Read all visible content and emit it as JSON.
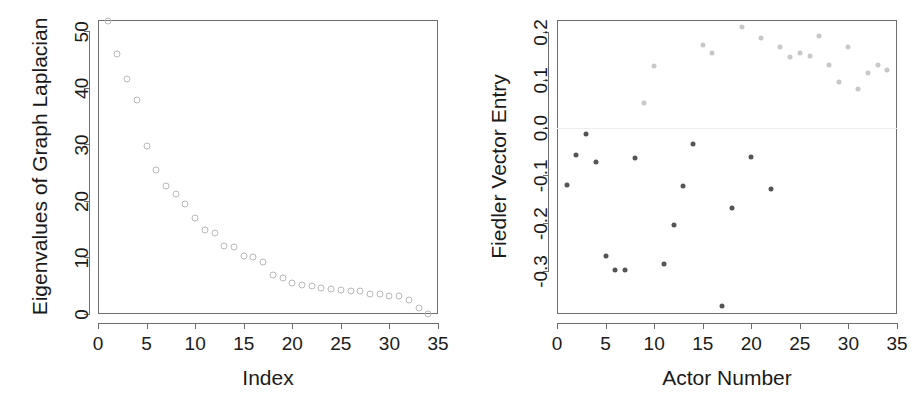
{
  "figure": {
    "panels": [
      "scree-plot",
      "fiedler-vector-plot"
    ]
  },
  "chart_data": [
    {
      "type": "scatter",
      "id": "scree-plot",
      "title": "",
      "xlabel": "Index",
      "ylabel": "Eigenvalues of Graph Laplacian",
      "xlim": [
        0,
        35
      ],
      "ylim": [
        0,
        52
      ],
      "xticks": [
        0,
        5,
        10,
        15,
        20,
        25,
        30,
        35
      ],
      "xticklabels": [
        "0",
        "5",
        "10",
        "15",
        "20",
        "25",
        "30",
        "35"
      ],
      "yticks": [
        0,
        10,
        20,
        30,
        40,
        50
      ],
      "yticklabels": [
        "0",
        "10",
        "20",
        "30",
        "40",
        "50"
      ],
      "grid": false,
      "legend": "none",
      "marker": "open-circle",
      "marker_color": "#b8b8b8",
      "x": [
        1,
        2,
        3,
        4,
        5,
        6,
        7,
        8,
        9,
        10,
        11,
        12,
        13,
        14,
        15,
        16,
        17,
        18,
        19,
        20,
        21,
        22,
        23,
        24,
        25,
        26,
        27,
        28,
        29,
        30,
        31,
        32,
        33,
        34
      ],
      "values": [
        51.9,
        45.9,
        41.6,
        37.9,
        29.7,
        25.5,
        22.7,
        21.3,
        19.4,
        17.0,
        14.8,
        14.4,
        12.0,
        11.9,
        10.2,
        10.0,
        9.2,
        6.9,
        6.3,
        5.4,
        5.1,
        4.9,
        4.6,
        4.4,
        4.3,
        4.1,
        4.0,
        3.6,
        3.5,
        3.2,
        3.1,
        2.4,
        1.0,
        0.0
      ]
    },
    {
      "type": "scatter",
      "id": "fiedler-vector-plot",
      "title": "",
      "xlabel": "Actor Number",
      "ylabel": "Fiedler Vector Entry",
      "xlim": [
        0,
        35
      ],
      "ylim": [
        -0.39,
        0.225
      ],
      "xticks": [
        0,
        5,
        10,
        15,
        20,
        25,
        30,
        35
      ],
      "xticklabels": [
        "0",
        "5",
        "10",
        "15",
        "20",
        "25",
        "30",
        "35"
      ],
      "yticks": [
        -0.3,
        -0.2,
        -0.1,
        0.0,
        0.1,
        0.2
      ],
      "yticklabels": [
        "-0.3",
        "-0.2",
        "-0.1",
        "0.0",
        "0.1",
        "0.2"
      ],
      "grid": false,
      "legend": "none",
      "marker": "filled-circle",
      "zero_reference_line": 0.0,
      "negative_color": "#555555",
      "positive_color": "#c8c8c8",
      "x": [
        1,
        2,
        3,
        4,
        5,
        6,
        7,
        8,
        9,
        10,
        11,
        12,
        13,
        14,
        15,
        16,
        17,
        18,
        19,
        20,
        21,
        22,
        23,
        24,
        25,
        26,
        27,
        28,
        29,
        30,
        31,
        32,
        33,
        34
      ],
      "values": [
        -0.121,
        -0.057,
        -0.014,
        -0.073,
        -0.269,
        -0.298,
        -0.297,
        -0.064,
        0.052,
        0.129,
        -0.286,
        -0.203,
        -0.122,
        -0.035,
        0.172,
        0.156,
        -0.374,
        -0.169,
        0.21,
        -0.062,
        0.187,
        -0.128,
        0.168,
        0.147,
        0.155,
        0.149,
        0.191,
        0.13,
        0.096,
        0.169,
        0.08,
        0.114,
        0.131,
        0.121
      ]
    }
  ]
}
